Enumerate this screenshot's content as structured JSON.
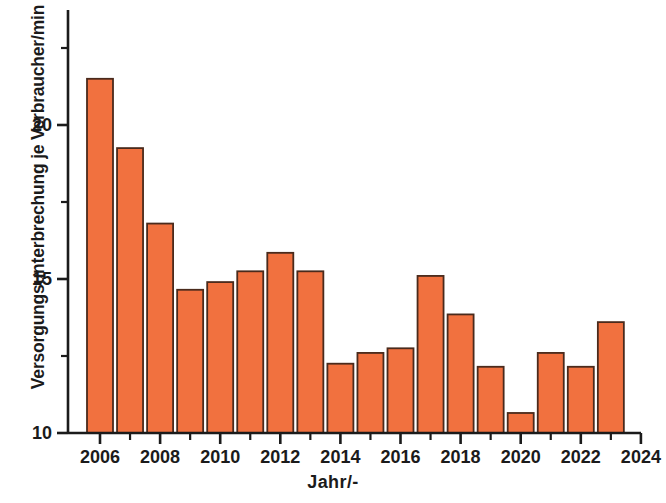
{
  "chart_data": {
    "type": "bar",
    "title": "",
    "xlabel": "Jahr/-",
    "ylabel": "Versorgungsunterbrechung je Verbraucher/min",
    "categories": [
      2006,
      2007,
      2008,
      2009,
      2010,
      2011,
      2012,
      2013,
      2014,
      2015,
      2016,
      2017,
      2018,
      2019,
      2020,
      2021,
      2022,
      2023
    ],
    "values": [
      21.5,
      19.25,
      16.8,
      14.65,
      14.9,
      15.25,
      15.85,
      15.25,
      12.25,
      12.6,
      12.75,
      15.1,
      13.85,
      12.15,
      10.65,
      12.6,
      12.15,
      13.6
    ],
    "series": [
      {
        "name": "Versorgungsunterbrechung je Verbraucher/min",
        "values": [
          21.5,
          19.25,
          16.8,
          14.65,
          14.9,
          15.25,
          15.85,
          15.25,
          12.25,
          12.6,
          12.75,
          15.1,
          13.85,
          12.15,
          10.65,
          12.6,
          12.15,
          13.6
        ]
      }
    ],
    "xlim": [
      2005.3,
      2024.3
    ],
    "ylim": [
      10,
      23.3
    ],
    "y_major_ticks": [
      10,
      15,
      20
    ],
    "y_major_tick_labels": [
      "10",
      "15",
      "20"
    ],
    "y_minor_ticks": [
      12.5,
      17.5,
      22.5
    ],
    "x_major_ticks": [
      2006,
      2008,
      2010,
      2012,
      2014,
      2016,
      2018,
      2020,
      2022,
      2024
    ],
    "x_major_tick_labels": [
      "2006",
      "2008",
      "2010",
      "2012",
      "2014",
      "2016",
      "2018",
      "2020",
      "2022",
      "2024"
    ],
    "x_minor_ticks": [
      2007,
      2009,
      2011,
      2013,
      2015,
      2017,
      2019,
      2021,
      2023
    ],
    "grid": false,
    "legend": false,
    "legend_position": "none",
    "bar_fill_color": "#F1713F",
    "bar_edge_color": "#4A2A1C",
    "axis_color": "#1b1b1b",
    "text_color": "#1b1b1b",
    "background_color": "#ffffff"
  }
}
